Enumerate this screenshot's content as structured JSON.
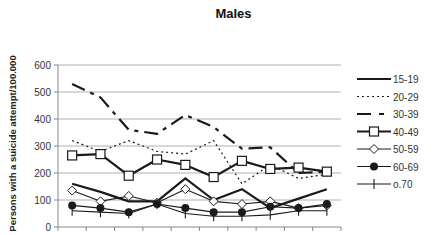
{
  "chart_data": {
    "type": "line",
    "title": "Males",
    "xlabel": "",
    "ylabel": "Persons with a suicide attempt/100.000",
    "ylim": [
      0,
      600
    ],
    "yticks": [
      0,
      100,
      200,
      300,
      400,
      500,
      600
    ],
    "grid": "horizontal",
    "legend_position": "right",
    "categories": [
      "1989",
      "1990",
      "1991",
      "1992",
      "1993",
      "1994",
      "1995",
      "1996",
      "1997",
      "1998"
    ],
    "series": [
      {
        "name": "15-19",
        "style": "solid-thick",
        "marker": "none",
        "values": [
          160,
          130,
          95,
          95,
          180,
          100,
          140,
          70,
          105,
          140
        ]
      },
      {
        "name": "20-29",
        "style": "dotted",
        "marker": "none",
        "values": [
          320,
          280,
          320,
          280,
          270,
          320,
          160,
          230,
          180,
          195
        ]
      },
      {
        "name": "30-39",
        "style": "long-dash",
        "marker": "none",
        "values": [
          530,
          480,
          360,
          345,
          415,
          370,
          290,
          295,
          200,
          205
        ]
      },
      {
        "name": "40-49",
        "style": "solid-thick",
        "marker": "square-open",
        "values": [
          265,
          270,
          190,
          250,
          230,
          185,
          245,
          215,
          220,
          205
        ]
      },
      {
        "name": "50-59",
        "style": "solid-thin",
        "marker": "diamond-open",
        "values": [
          135,
          95,
          115,
          90,
          140,
          95,
          85,
          95,
          70,
          80
        ]
      },
      {
        "name": "60-69",
        "style": "solid-thin",
        "marker": "circle-filled",
        "values": [
          80,
          70,
          55,
          85,
          70,
          55,
          55,
          75,
          70,
          85
        ]
      },
      {
        "name": "o.70",
        "style": "solid-thin",
        "marker": "plus",
        "values": [
          60,
          55,
          50,
          85,
          50,
          40,
          40,
          45,
          60,
          60
        ]
      }
    ]
  },
  "colors": {
    "line": "#1a1a1a",
    "grid": "#b0b0b0",
    "axis": "#888888",
    "text": "#333333"
  }
}
